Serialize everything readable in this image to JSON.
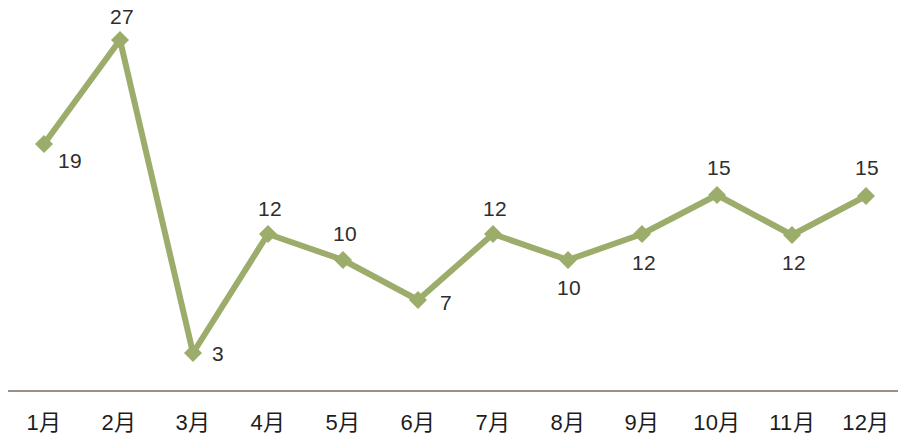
{
  "chart_data": {
    "type": "line",
    "title": "",
    "subtitle": "",
    "xlabel": "",
    "ylabel": "",
    "categories": [
      "1月",
      "2月",
      "3月",
      "4月",
      "5月",
      "6月",
      "7月",
      "8月",
      "9月",
      "10月",
      "11月",
      "12月"
    ],
    "values": [
      19,
      27,
      3,
      12,
      10,
      7,
      12,
      10,
      12,
      15,
      12,
      15
    ],
    "series": [
      {
        "name": "",
        "values": [
          19,
          27,
          3,
          12,
          10,
          7,
          12,
          10,
          12,
          15,
          12,
          15
        ]
      }
    ],
    "data_labels": [
      "19",
      "27",
      "3",
      "12",
      "10",
      "7",
      "12",
      "10",
      "12",
      "15",
      "12",
      "15"
    ],
    "ylim": [
      0,
      29
    ],
    "grid": false,
    "legend": false,
    "legend_position": "none",
    "marker": "diamond",
    "line_color": "#9cad6b",
    "marker_color": "#9cad6b",
    "label_color": "#2e2e2e",
    "axis_color": "#9b8f86",
    "background_color": "#ffffff",
    "y_axis_visible": false,
    "x_axis_visible": true
  },
  "axis": {
    "ticks": [
      {
        "label": "1月",
        "x": 44
      },
      {
        "label": "2月",
        "x": 119
      },
      {
        "label": "3月",
        "x": 193
      },
      {
        "label": "4月",
        "x": 268
      },
      {
        "label": "5月",
        "x": 343
      },
      {
        "label": "6月",
        "x": 418
      },
      {
        "label": "7月",
        "x": 493
      },
      {
        "label": "8月",
        "x": 568
      },
      {
        "label": "9月",
        "x": 642
      },
      {
        "label": "10月",
        "x": 717
      },
      {
        "label": "11月",
        "x": 792
      },
      {
        "label": "12月",
        "x": 866
      }
    ]
  },
  "points": [
    {
      "month": "1月",
      "value": "19",
      "cx": 44,
      "cy": 144,
      "label_x": 58,
      "label_y": 150
    },
    {
      "month": "2月",
      "value": "27",
      "cx": 120,
      "cy": 40,
      "label_x": 110,
      "label_y": 6
    },
    {
      "month": "3月",
      "value": "3",
      "cx": 193,
      "cy": 353,
      "label_x": 212,
      "label_y": 343
    },
    {
      "month": "4月",
      "value": "12",
      "cx": 268,
      "cy": 234,
      "label_x": 258,
      "label_y": 198
    },
    {
      "month": "5月",
      "value": "10",
      "cx": 343,
      "cy": 260,
      "label_x": 333,
      "label_y": 223
    },
    {
      "month": "6月",
      "value": "7",
      "cx": 418,
      "cy": 300,
      "label_x": 440,
      "label_y": 292
    },
    {
      "month": "7月",
      "value": "12",
      "cx": 493,
      "cy": 234,
      "label_x": 483,
      "label_y": 198
    },
    {
      "month": "8月",
      "value": "10",
      "cx": 568,
      "cy": 260,
      "label_x": 557,
      "label_y": 277
    },
    {
      "month": "9月",
      "value": "12",
      "cx": 642,
      "cy": 234,
      "label_x": 632,
      "label_y": 252
    },
    {
      "month": "10月",
      "value": "15",
      "cx": 717,
      "cy": 195,
      "label_x": 707,
      "label_y": 157
    },
    {
      "month": "11月",
      "value": "12",
      "cx": 792,
      "cy": 235,
      "label_x": 782,
      "label_y": 252
    },
    {
      "month": "12月",
      "value": "15",
      "cx": 866,
      "cy": 196,
      "label_x": 855,
      "label_y": 157
    }
  ]
}
